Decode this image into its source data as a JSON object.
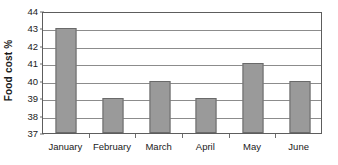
{
  "chart_data": {
    "type": "bar",
    "title": "",
    "subtitle": "",
    "xlabel": "",
    "ylabel": "Food cost %",
    "categories": [
      "January",
      "February",
      "March",
      "April",
      "May",
      "June"
    ],
    "values": [
      43,
      39,
      40,
      39,
      41,
      40
    ],
    "series": [
      {
        "name": "Food cost %",
        "values": [
          43,
          39,
          40,
          39,
          41,
          40
        ]
      }
    ],
    "ylim": [
      37,
      44
    ],
    "ytick_step": 1,
    "ytick_labels": [
      "44",
      "43",
      "42",
      "41",
      "40",
      "39",
      "38",
      "37"
    ],
    "ytick_values": [
      44,
      43,
      42,
      41,
      40,
      39,
      38,
      37
    ],
    "grid": true,
    "grid_axis": "y",
    "legend": false,
    "legend_position": "none",
    "annotations": [],
    "colors": {
      "bar_fill": "#9a9a9a",
      "bar_stroke": "#6a6a6a",
      "gridline": "#8c8c8c",
      "axis": "#5d5d5d",
      "text": "#1a1a1a",
      "background": "#ffffff"
    }
  }
}
